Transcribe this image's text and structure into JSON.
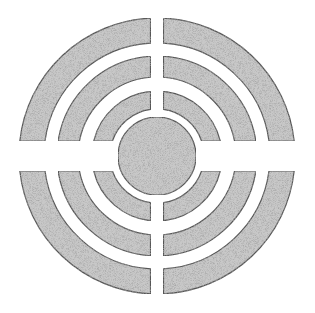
{
  "figure": {
    "center": [
      157,
      156
    ],
    "fill_color": "#c8c8c8",
    "stroke_color": "#555555",
    "background": "#ffffff",
    "center_disk": {
      "radius": 39
    },
    "rings": [
      {
        "name": "inner-ring",
        "r_inner": 47,
        "r_outer": 65
      },
      {
        "name": "middle-ring",
        "r_inner": 79,
        "r_outer": 100
      },
      {
        "name": "outer-ring",
        "r_inner": 113,
        "r_outer": 138
      }
    ],
    "gaps": {
      "vertical_px": 13,
      "horizontal_px": 30
    },
    "quadrants": [
      "upper-left",
      "upper-right",
      "lower-left",
      "lower-right"
    ]
  }
}
